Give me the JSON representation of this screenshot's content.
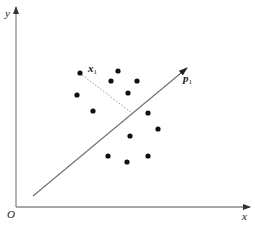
{
  "diagram": {
    "type": "scatter-projection",
    "axes": {
      "x_label": "x",
      "y_label": "y",
      "origin_label": "O",
      "color": "#7a7a7a"
    },
    "vector": {
      "label_main": "p",
      "label_sub": "1",
      "start": [
        33,
        196
      ],
      "end": [
        187,
        68
      ],
      "color": "#6f6f6f"
    },
    "highlighted_point": {
      "label_main": "x",
      "label_sub": "1",
      "position": [
        80,
        73
      ],
      "projection_foot": [
        132,
        113
      ]
    },
    "points": [
      [
        80,
        73
      ],
      [
        118,
        71
      ],
      [
        111,
        81
      ],
      [
        137,
        81
      ],
      [
        77,
        95
      ],
      [
        128,
        93
      ],
      [
        93,
        111
      ],
      [
        148,
        113
      ],
      [
        158,
        129
      ],
      [
        130,
        136
      ],
      [
        108,
        156
      ],
      [
        127,
        162
      ],
      [
        148,
        156
      ]
    ],
    "point_color": "#111111"
  }
}
